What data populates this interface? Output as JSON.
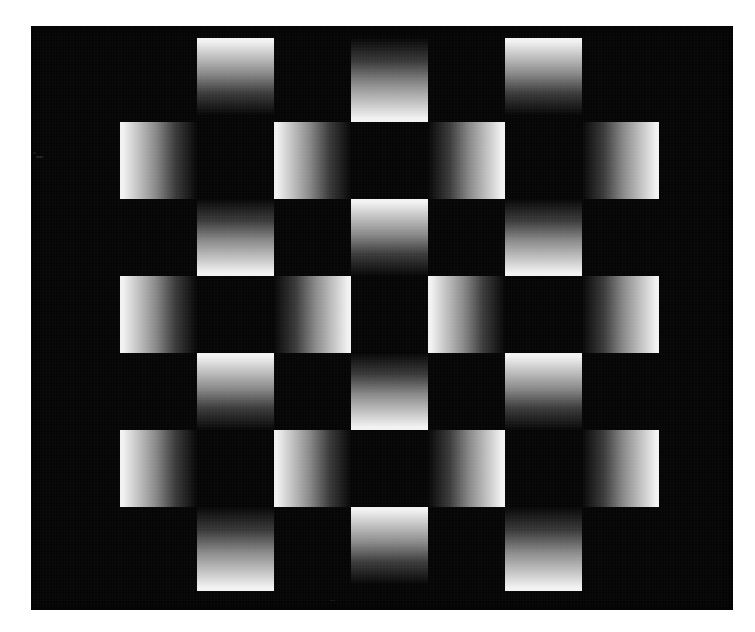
{
  "figure": {
    "kind": "gradient-checkerboard-illusion",
    "page_background": "#ffffff",
    "canvas": {
      "x": 31,
      "y": 26,
      "width": 702,
      "height": 584,
      "background_color": "#050505"
    },
    "grid": {
      "columns": 7,
      "rows": 7,
      "cell_width": 77,
      "cell_height": 77,
      "origin_x": 120,
      "origin_y": 38,
      "pattern": "checkerboard",
      "filled_rule": "(row + col) is even"
    },
    "gradient": {
      "bright_color": "#f2f2f2",
      "mid_color": "#8a8a8a",
      "dark_color": "#060606",
      "note": "each filled square ramps from bright on the edge-facing side to black toward the centre of the figure",
      "row_orientation": "horizontal gradients on even rows, vertical gradients on odd rows"
    },
    "cells": [
      {
        "row": 0,
        "col": 1,
        "axis": "vertical",
        "bright_end": "top",
        "left": 197,
        "top": 38,
        "w": 77,
        "h": 77
      },
      {
        "row": 0,
        "col": 3,
        "axis": "vertical",
        "bright_end": "bottom",
        "left": 351,
        "top": 38,
        "w": 77,
        "h": 84
      },
      {
        "row": 0,
        "col": 5,
        "axis": "vertical",
        "bright_end": "top",
        "left": 505,
        "top": 38,
        "w": 77,
        "h": 77
      },
      {
        "row": 1,
        "col": 0,
        "axis": "horizontal",
        "bright_end": "left",
        "left": 120,
        "top": 122,
        "w": 77,
        "h": 77
      },
      {
        "row": 1,
        "col": 2,
        "axis": "horizontal",
        "bright_end": "left",
        "left": 274,
        "top": 122,
        "w": 77,
        "h": 77
      },
      {
        "row": 1,
        "col": 4,
        "axis": "horizontal",
        "bright_end": "right",
        "left": 428,
        "top": 122,
        "w": 77,
        "h": 77
      },
      {
        "row": 1,
        "col": 6,
        "axis": "horizontal",
        "bright_end": "right",
        "left": 582,
        "top": 122,
        "w": 77,
        "h": 77
      },
      {
        "row": 2,
        "col": 1,
        "axis": "vertical",
        "bright_end": "bottom",
        "left": 197,
        "top": 199,
        "w": 77,
        "h": 77
      },
      {
        "row": 2,
        "col": 3,
        "axis": "vertical",
        "bright_end": "top",
        "left": 351,
        "top": 199,
        "w": 77,
        "h": 77
      },
      {
        "row": 2,
        "col": 5,
        "axis": "vertical",
        "bright_end": "bottom",
        "left": 505,
        "top": 199,
        "w": 77,
        "h": 77
      },
      {
        "row": 3,
        "col": 0,
        "axis": "horizontal",
        "bright_end": "left",
        "left": 120,
        "top": 276,
        "w": 77,
        "h": 77
      },
      {
        "row": 3,
        "col": 2,
        "axis": "horizontal",
        "bright_end": "right",
        "left": 274,
        "top": 276,
        "w": 77,
        "h": 77
      },
      {
        "row": 3,
        "col": 4,
        "axis": "horizontal",
        "bright_end": "left",
        "left": 428,
        "top": 276,
        "w": 77,
        "h": 77
      },
      {
        "row": 3,
        "col": 6,
        "axis": "horizontal",
        "bright_end": "right",
        "left": 582,
        "top": 276,
        "w": 77,
        "h": 77
      },
      {
        "row": 4,
        "col": 1,
        "axis": "vertical",
        "bright_end": "top",
        "left": 197,
        "top": 353,
        "w": 77,
        "h": 77
      },
      {
        "row": 4,
        "col": 3,
        "axis": "vertical",
        "bright_end": "bottom",
        "left": 351,
        "top": 353,
        "w": 77,
        "h": 77
      },
      {
        "row": 4,
        "col": 5,
        "axis": "vertical",
        "bright_end": "top",
        "left": 505,
        "top": 353,
        "w": 77,
        "h": 77
      },
      {
        "row": 5,
        "col": 0,
        "axis": "horizontal",
        "bright_end": "left",
        "left": 120,
        "top": 430,
        "w": 77,
        "h": 77
      },
      {
        "row": 5,
        "col": 2,
        "axis": "horizontal",
        "bright_end": "left",
        "left": 274,
        "top": 430,
        "w": 77,
        "h": 77
      },
      {
        "row": 5,
        "col": 4,
        "axis": "horizontal",
        "bright_end": "right",
        "left": 428,
        "top": 430,
        "w": 77,
        "h": 77
      },
      {
        "row": 5,
        "col": 6,
        "axis": "horizontal",
        "bright_end": "right",
        "left": 582,
        "top": 430,
        "w": 77,
        "h": 77
      },
      {
        "row": 6,
        "col": 1,
        "axis": "vertical",
        "bright_end": "bottom",
        "left": 197,
        "top": 507,
        "w": 77,
        "h": 84
      },
      {
        "row": 6,
        "col": 3,
        "axis": "vertical",
        "bright_end": "top",
        "left": 351,
        "top": 507,
        "w": 77,
        "h": 77
      },
      {
        "row": 6,
        "col": 5,
        "axis": "vertical",
        "bright_end": "bottom",
        "left": 505,
        "top": 507,
        "w": 77,
        "h": 84
      }
    ],
    "specks": [
      {
        "left": 36,
        "top": 156,
        "w": 7,
        "h": 2,
        "alpha": 0.45
      },
      {
        "left": 33,
        "top": 152,
        "w": 3,
        "h": 2,
        "alpha": 0.3
      },
      {
        "left": 330,
        "top": 600,
        "w": 5,
        "h": 1,
        "alpha": 0.25
      }
    ]
  }
}
